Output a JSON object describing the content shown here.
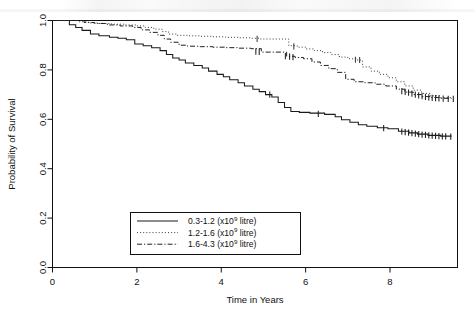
{
  "figure": {
    "kind": "kaplan-meier-survival-plot",
    "background_color": "#ffffff",
    "foreground_color": "#000000"
  },
  "axes": {
    "x_title": "Time in Years",
    "y_title": "Probability of Survival",
    "x_ticks": [
      "0",
      "2",
      "4",
      "6",
      "8"
    ],
    "y_ticks": [
      "0.0",
      "0.2",
      "0.4",
      "0.6",
      "0.8",
      "1.0"
    ]
  },
  "legend": {
    "entries": [
      {
        "label": "0.3-1.2 (x10",
        "sup": "9",
        "tail": " litre)",
        "style": "solid"
      },
      {
        "label": "1.2-1.6 (x10",
        "sup": "9",
        "tail": " litre)",
        "style": "dotted"
      },
      {
        "label": "1.6-4.3 (x10",
        "sup": "9",
        "tail": " litre)",
        "style": "dashdot"
      }
    ]
  },
  "chart_data": {
    "type": "line",
    "title": "",
    "xlabel": "Time in Years",
    "ylabel": "Probability of Survival",
    "xlim": [
      0,
      9.6
    ],
    "ylim": [
      0.0,
      1.0
    ],
    "xticks": [
      0,
      2,
      4,
      6,
      8
    ],
    "yticks": [
      0.0,
      0.2,
      0.4,
      0.6,
      0.8,
      1.0
    ],
    "grid": false,
    "legend_position": "lower-center-inside",
    "curve_type": "step",
    "censoring_marks": true,
    "series": [
      {
        "name": "0.3-1.2 (x10^9 litre)",
        "style": "solid",
        "color": "#1a1a1a",
        "points": [
          [
            0.0,
            1.0
          ],
          [
            0.35,
            1.0
          ],
          [
            0.4,
            0.983
          ],
          [
            0.55,
            0.972
          ],
          [
            0.7,
            0.96
          ],
          [
            0.9,
            0.945
          ],
          [
            1.1,
            0.938
          ],
          [
            1.35,
            0.932
          ],
          [
            1.55,
            0.928
          ],
          [
            1.75,
            0.922
          ],
          [
            1.95,
            0.905
          ],
          [
            2.15,
            0.898
          ],
          [
            2.35,
            0.89
          ],
          [
            2.55,
            0.878
          ],
          [
            2.7,
            0.862
          ],
          [
            2.85,
            0.848
          ],
          [
            3.0,
            0.84
          ],
          [
            3.15,
            0.828
          ],
          [
            3.35,
            0.818
          ],
          [
            3.55,
            0.808
          ],
          [
            3.7,
            0.795
          ],
          [
            3.9,
            0.782
          ],
          [
            4.05,
            0.772
          ],
          [
            4.2,
            0.76
          ],
          [
            4.4,
            0.748
          ],
          [
            4.55,
            0.735
          ],
          [
            4.75,
            0.722
          ],
          [
            4.9,
            0.712
          ],
          [
            5.05,
            0.7
          ],
          [
            5.2,
            0.69
          ],
          [
            5.35,
            0.668
          ],
          [
            5.5,
            0.648
          ],
          [
            5.65,
            0.632
          ],
          [
            5.85,
            0.628
          ],
          [
            6.1,
            0.625
          ],
          [
            6.45,
            0.62
          ],
          [
            6.7,
            0.61
          ],
          [
            6.85,
            0.598
          ],
          [
            7.05,
            0.588
          ],
          [
            7.25,
            0.578
          ],
          [
            7.45,
            0.572
          ],
          [
            7.7,
            0.566
          ],
          [
            7.95,
            0.562
          ],
          [
            8.2,
            0.552
          ],
          [
            8.45,
            0.545
          ],
          [
            8.65,
            0.54
          ],
          [
            8.9,
            0.535
          ],
          [
            9.2,
            0.532
          ],
          [
            9.45,
            0.53
          ]
        ],
        "censored": [
          [
            5.15,
            0.7
          ],
          [
            6.3,
            0.622
          ],
          [
            7.85,
            0.564
          ],
          [
            8.28,
            0.55
          ],
          [
            8.36,
            0.548
          ],
          [
            8.44,
            0.546
          ],
          [
            8.52,
            0.544
          ],
          [
            8.6,
            0.542
          ],
          [
            8.68,
            0.54
          ],
          [
            8.76,
            0.538
          ],
          [
            8.84,
            0.537
          ],
          [
            8.92,
            0.535
          ],
          [
            9.0,
            0.534
          ],
          [
            9.08,
            0.533
          ],
          [
            9.16,
            0.532
          ],
          [
            9.24,
            0.531
          ],
          [
            9.32,
            0.531
          ],
          [
            9.44,
            0.53
          ]
        ]
      },
      {
        "name": "1.2-1.6 (x10^9 litre)",
        "style": "dotted",
        "color": "#3a3a3a",
        "points": [
          [
            0.0,
            1.0
          ],
          [
            0.45,
            1.0
          ],
          [
            0.6,
            0.995
          ],
          [
            0.85,
            0.99
          ],
          [
            1.1,
            0.988
          ],
          [
            1.4,
            0.985
          ],
          [
            1.7,
            0.982
          ],
          [
            2.0,
            0.978
          ],
          [
            2.2,
            0.972
          ],
          [
            2.4,
            0.965
          ],
          [
            2.6,
            0.955
          ],
          [
            2.75,
            0.945
          ],
          [
            2.95,
            0.94
          ],
          [
            3.2,
            0.938
          ],
          [
            3.5,
            0.936
          ],
          [
            3.8,
            0.934
          ],
          [
            4.1,
            0.932
          ],
          [
            4.4,
            0.93
          ],
          [
            4.7,
            0.928
          ],
          [
            4.9,
            0.925
          ],
          [
            5.6,
            0.898
          ],
          [
            5.8,
            0.892
          ],
          [
            6.0,
            0.885
          ],
          [
            6.2,
            0.878
          ],
          [
            6.4,
            0.87
          ],
          [
            6.6,
            0.862
          ],
          [
            6.8,
            0.852
          ],
          [
            7.0,
            0.845
          ],
          [
            7.2,
            0.84
          ],
          [
            7.35,
            0.812
          ],
          [
            7.55,
            0.795
          ],
          [
            7.75,
            0.782
          ],
          [
            7.95,
            0.768
          ],
          [
            8.15,
            0.752
          ],
          [
            8.35,
            0.735
          ],
          [
            8.55,
            0.718
          ],
          [
            8.75,
            0.705
          ],
          [
            8.95,
            0.695
          ],
          [
            9.2,
            0.688
          ],
          [
            9.45,
            0.685
          ]
        ],
        "censored": [
          [
            4.85,
            0.926
          ],
          [
            5.72,
            0.895
          ],
          [
            7.18,
            0.841
          ],
          [
            7.28,
            0.84
          ]
        ]
      },
      {
        "name": "1.6-4.3 (x10^9 litre)",
        "style": "dashdot",
        "color": "#1f1f1f",
        "points": [
          [
            0.0,
            1.0
          ],
          [
            0.5,
            1.0
          ],
          [
            0.75,
            0.992
          ],
          [
            1.0,
            0.988
          ],
          [
            1.3,
            0.982
          ],
          [
            1.6,
            0.978
          ],
          [
            1.9,
            0.972
          ],
          [
            2.1,
            0.962
          ],
          [
            2.3,
            0.952
          ],
          [
            2.5,
            0.94
          ],
          [
            2.65,
            0.925
          ],
          [
            2.8,
            0.912
          ],
          [
            3.0,
            0.9
          ],
          [
            3.2,
            0.896
          ],
          [
            3.5,
            0.894
          ],
          [
            3.8,
            0.892
          ],
          [
            4.1,
            0.89
          ],
          [
            4.4,
            0.888
          ],
          [
            4.7,
            0.886
          ],
          [
            4.95,
            0.872
          ],
          [
            5.55,
            0.855
          ],
          [
            5.75,
            0.85
          ],
          [
            5.95,
            0.845
          ],
          [
            6.15,
            0.832
          ],
          [
            6.35,
            0.818
          ],
          [
            6.55,
            0.805
          ],
          [
            6.75,
            0.79
          ],
          [
            6.95,
            0.762
          ],
          [
            7.15,
            0.752
          ],
          [
            7.4,
            0.748
          ],
          [
            7.65,
            0.742
          ],
          [
            7.9,
            0.735
          ],
          [
            8.15,
            0.722
          ],
          [
            8.35,
            0.71
          ],
          [
            8.55,
            0.7
          ],
          [
            8.75,
            0.692
          ],
          [
            8.95,
            0.688
          ],
          [
            9.2,
            0.685
          ],
          [
            9.45,
            0.683
          ]
        ],
        "censored": [
          [
            4.82,
            0.874
          ],
          [
            4.9,
            0.873
          ],
          [
            5.52,
            0.856
          ],
          [
            5.62,
            0.854
          ],
          [
            5.7,
            0.852
          ],
          [
            8.28,
            0.714
          ],
          [
            8.36,
            0.711
          ],
          [
            8.44,
            0.708
          ],
          [
            8.52,
            0.704
          ],
          [
            8.6,
            0.7
          ],
          [
            8.68,
            0.697
          ],
          [
            8.76,
            0.694
          ],
          [
            8.84,
            0.691
          ],
          [
            8.92,
            0.689
          ],
          [
            9.0,
            0.687
          ],
          [
            9.08,
            0.686
          ],
          [
            9.16,
            0.685
          ],
          [
            9.26,
            0.684
          ],
          [
            9.38,
            0.683
          ],
          [
            9.5,
            0.683
          ]
        ]
      }
    ]
  }
}
